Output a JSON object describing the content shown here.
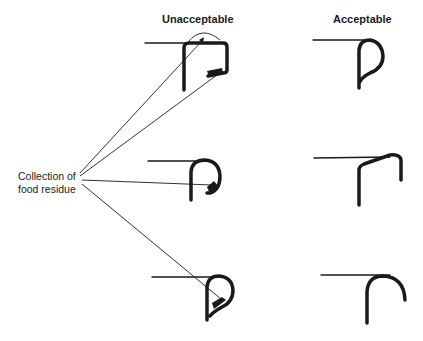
{
  "diagram": {
    "columns": [
      {
        "label": "Unacceptable"
      },
      {
        "label": "Acceptable"
      }
    ],
    "callout": {
      "line1": "Collection of",
      "line2": "food residue",
      "targets": 4
    },
    "rows": [
      {
        "unacceptable": "square box hem with residue traps at top corner and inner lip",
        "acceptable": "teardrop closed hem"
      },
      {
        "unacceptable": "open round curl with residue trap at inner end",
        "acceptable": "open angular right-angle bend"
      },
      {
        "unacceptable": "teardrop curl with residue trap inside loop",
        "acceptable": "open round J-curl"
      }
    ],
    "colors": {
      "ink": "#1a1a1a",
      "background": "#ffffff"
    }
  }
}
